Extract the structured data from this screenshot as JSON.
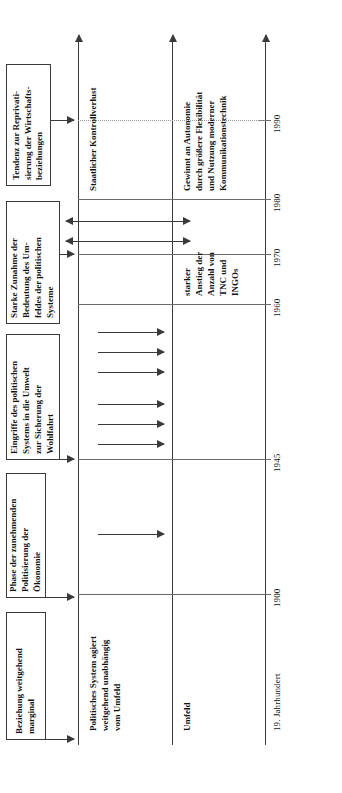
{
  "figure": {
    "orientation": "rotated-90",
    "axis_color": "#3a3a3a"
  },
  "timeline": {
    "label_start": "19. Jahrhundert",
    "ticks": [
      {
        "label": "19. Jahrhundert",
        "pos": 0.06
      },
      {
        "label": "1900",
        "pos": 0.265
      },
      {
        "label": "1945",
        "pos": 0.448
      },
      {
        "label": "1960",
        "pos": 0.637
      },
      {
        "label": "1970",
        "pos": 0.704
      },
      {
        "label": "1980",
        "pos": 0.774
      },
      {
        "label": "1990",
        "pos": 0.877
      }
    ]
  },
  "lanes": [
    {
      "name": "political-system-lane",
      "label": "Politisches System agiert\nweitgehend unabhängig\nvom Umfeld"
    },
    {
      "name": "state-control-lane",
      "label": "Staatlicher Kontrollverlust"
    },
    {
      "name": "environment-lane",
      "label": "Umfeld"
    },
    {
      "name": "autonomy-lane",
      "label": "Gewinnt an Autonomie\ndurch größere Flexibilität\nund Nutzung moderner\nKommunikationstechnik"
    },
    {
      "name": "tnc-ingo-lane",
      "label": "starker\nAnstieg der\nAnzahl von\nTNC und\nINGOs"
    }
  ],
  "phase_boxes": [
    {
      "name": "phase-box-marginal",
      "text": "Beziehung weitgehend\nmarginal"
    },
    {
      "name": "phase-box-politisierung",
      "text": "Phase der zunehmenden\nPolitisierung der\nÖkonomie"
    },
    {
      "name": "phase-box-eingriffe",
      "text": "Eingriffe des politischen\nSystems in die Umwelt\nzur Sicherung der\nWohlfahrt"
    },
    {
      "name": "phase-box-zunahme",
      "text": "Starke Zunahme der\nBedeutung des Um-\nfeldes der politischen\nSysteme"
    },
    {
      "name": "phase-box-reprivatisierung",
      "text": "Tendenz zur Reprivati-\nsierung der Wirtschafts-\nbeziehungen"
    }
  ],
  "flows": {
    "single_1900_1945_count": 1,
    "single_1945_1960_count": 6,
    "double_1970_1980_count": 2
  }
}
